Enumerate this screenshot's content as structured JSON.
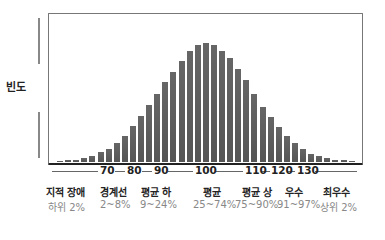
{
  "chart_data": {
    "type": "bar",
    "title": "",
    "xlabel": "IQ",
    "ylabel": "빈도",
    "x_ticks": [
      "70",
      "80",
      "90",
      "100",
      "110",
      "120",
      "130"
    ],
    "values": [
      1,
      1.5,
      2,
      3,
      5,
      8,
      11,
      16,
      22,
      30,
      39,
      48,
      57,
      67,
      76,
      85,
      93,
      98,
      100,
      98,
      93,
      87,
      78,
      69,
      57,
      46,
      38,
      29,
      22,
      16,
      11,
      7,
      5,
      3,
      2,
      1.5,
      1
    ],
    "categories_legend": [
      {
        "label": "지적 장애",
        "range": "하위 2%"
      },
      {
        "label": "경계선",
        "range": "2~8%"
      },
      {
        "label": "평균 하",
        "range": "9~24%"
      },
      {
        "label": "평균",
        "range": "25~74%"
      },
      {
        "label": "평균 상",
        "range": "75~90%"
      },
      {
        "label": "우수",
        "range": "91~97%"
      },
      {
        "label": "최우수",
        "range": "상위 2%"
      }
    ],
    "grid": false
  },
  "ylabel": "빈도",
  "ticks": [
    "70",
    "80",
    "90",
    "100",
    "110",
    "120",
    "130"
  ],
  "categories": [
    {
      "label": "지적 장애",
      "range": "하위 2%"
    },
    {
      "label": "경계선",
      "range": "2~8%"
    },
    {
      "label": "평균 하",
      "range": "9~24%"
    },
    {
      "label": "평균",
      "range": "25~74%"
    },
    {
      "label": "평균 상",
      "range": "75~90%"
    },
    {
      "label": "우수",
      "range": "91~97%"
    },
    {
      "label": "최우수",
      "range": "상위 2%"
    }
  ],
  "colors": {
    "bar": "#5a5a5a",
    "frame": "#777777",
    "muted": "#888888"
  }
}
